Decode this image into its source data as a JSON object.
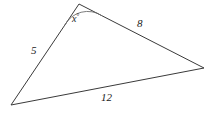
{
  "figure": {
    "type": "triangle-diagram",
    "background_color": "#ffffff",
    "stroke_color": "#3a3a3a",
    "text_color": "#1a1a1a",
    "width": 219,
    "height": 120,
    "vertices": {
      "apex": {
        "x": 79,
        "y": 4
      },
      "bottom_left": {
        "x": 11,
        "y": 105
      },
      "right": {
        "x": 204,
        "y": 68
      }
    },
    "sides": [
      {
        "name": "left-side",
        "label": "5",
        "from": "apex",
        "to": "bottom_left"
      },
      {
        "name": "upper-right-side",
        "label": "8",
        "from": "apex",
        "to": "right"
      },
      {
        "name": "bottom-side",
        "label": "12",
        "from": "bottom_left",
        "to": "right"
      }
    ],
    "angle": {
      "name": "apex-angle",
      "at_vertex": "apex",
      "label": "x",
      "unit_symbol": "°",
      "arc_radius": 26
    }
  }
}
